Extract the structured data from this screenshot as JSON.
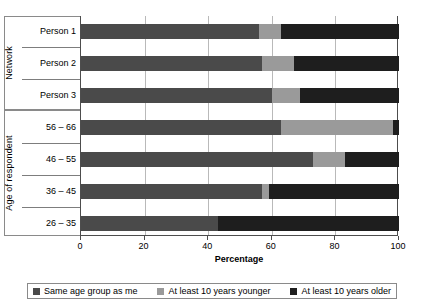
{
  "chart_data": {
    "type": "bar",
    "orientation": "horizontal",
    "stacked": true,
    "stack_mode": "percent",
    "title": "",
    "xlabel": "Percentage",
    "ylabel": "",
    "xlim": [
      0,
      100
    ],
    "xticks": [
      0,
      20,
      40,
      60,
      80,
      100
    ],
    "grid": true,
    "legend_position": "bottom",
    "categories": [
      "Person 1",
      "Person 2",
      "Person 3",
      "56 – 66",
      "46 – 55",
      "36 – 45",
      "26 – 35"
    ],
    "groups": [
      {
        "label": "Network",
        "categories": [
          "Person 1",
          "Person 2",
          "Person 3"
        ]
      },
      {
        "label": "Age of respondent",
        "categories": [
          "56 – 66",
          "46 – 55",
          "36 – 45",
          "26 – 35"
        ]
      }
    ],
    "series": [
      {
        "name": "Same age group as me",
        "color": "#4a4a4a",
        "values": [
          56,
          57,
          60,
          63,
          73,
          57,
          43
        ]
      },
      {
        "name": "At least 10 years younger",
        "color": "#9a9a9a",
        "values": [
          7,
          10,
          9,
          35,
          10,
          2,
          0
        ]
      },
      {
        "name": "At least 10 years older",
        "color": "#1e1e1e",
        "values": [
          37,
          33,
          31,
          2,
          17,
          41,
          57
        ]
      }
    ]
  },
  "axis": {
    "x_title": "Percentage",
    "tick_labels": [
      "0",
      "20",
      "40",
      "60",
      "80",
      "100"
    ]
  },
  "group_labels": {
    "network": "Network",
    "age": "Age of respondent"
  },
  "category_labels": {
    "person_1": "Person 1",
    "person_2": "Person 2",
    "person_3": "Person 3",
    "age_56_66": "56 – 66",
    "age_46_55": "46 – 55",
    "age_36_45": "36 – 45",
    "age_26_35": "26 – 35"
  },
  "legend": {
    "items": [
      {
        "label": "Same age group as me",
        "color": "#4a4a4a"
      },
      {
        "label": "At least 10 years younger",
        "color": "#9a9a9a"
      },
      {
        "label": "At least 10 years older",
        "color": "#1e1e1e"
      }
    ]
  }
}
